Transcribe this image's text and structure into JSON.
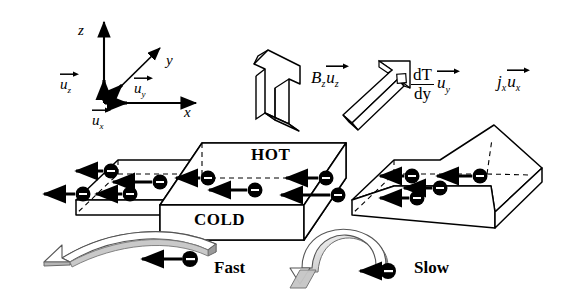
{
  "figure": {
    "colors": {
      "line": "#000000",
      "background": "#ffffff",
      "ribbon_light": "#d9d9d9",
      "ribbon_mid": "#a8a8a8",
      "ribbon_dark": "#7a7a7a"
    }
  },
  "axes": {
    "label_z": "z",
    "label_y": "y",
    "label_x": "x",
    "unit_z": {
      "symbol": "u",
      "sub": "z"
    },
    "unit_y": {
      "symbol": "u",
      "sub": "y"
    },
    "unit_x": {
      "symbol": "u",
      "sub": "x"
    }
  },
  "field_labels": {
    "magnetic": {
      "symbol": "B",
      "sub": "z",
      "unit": "u",
      "unit_sub": "z"
    },
    "thermal": {
      "numerator": "dT",
      "denominator": "dy",
      "unit": "u",
      "unit_sub": "y"
    },
    "current": {
      "symbol": "j",
      "sub": "x",
      "unit": "u",
      "unit_sub": "x"
    }
  },
  "slab": {
    "hot_label": "HOT",
    "cold_label": "COLD"
  },
  "carriers": {
    "charge_sign": "−",
    "fast_label": "Fast",
    "slow_label": "Slow",
    "left_slab_count": 4,
    "center_slab_count": 5,
    "right_slab_count": 5
  }
}
